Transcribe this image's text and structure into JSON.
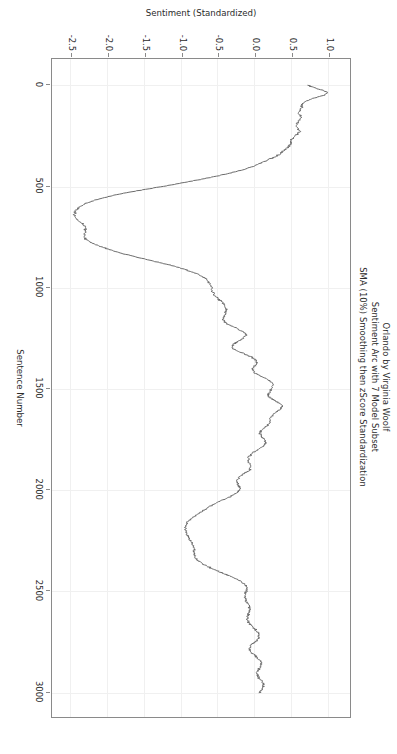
{
  "figure": {
    "title_lines": [
      "Orlando by Virginia Woolf",
      "Sentiment Arc with 7 Model Subset",
      "SMA (10%) Smoothing then zScore Standardization"
    ],
    "rotation_note": "90",
    "background_color": "#ffffff",
    "line_color": "#6b6b6b",
    "grid_color": "#f0f0f0",
    "frame_color": "#8a8a8a"
  },
  "chart_data": {
    "type": "line",
    "title": "Orlando by Virginia Woolf\nSentiment Arc with 7 Model Subset\nSMA (10%) Smoothing then zScore Standardization",
    "xlabel": "Sentence Number",
    "ylabel": "Sentiment (Standardized)",
    "xlim": [
      -130,
      3130
    ],
    "ylim": [
      -2.78,
      1.28
    ],
    "xticks": [
      0,
      500,
      1000,
      1500,
      2000,
      2500,
      3000
    ],
    "xticklabels": [
      "0",
      "500",
      "1000",
      "1500",
      "2000",
      "2500",
      "3000"
    ],
    "yticks": [
      1.0,
      0.5,
      0.0,
      -0.5,
      -1.0,
      -1.5,
      -2.0,
      -2.5
    ],
    "yticklabels": [
      "1.0",
      "0.5",
      "0.0",
      "-0.5",
      "-1.0",
      "-1.5",
      "-2.0",
      "-2.5"
    ],
    "grid": true,
    "legend": null,
    "series": [
      {
        "name": "Sentiment (Standardized)",
        "color": "#6b6b6b",
        "linewidth": 1.0,
        "x": [
          0,
          12,
          24,
          36,
          48,
          60,
          72,
          84,
          96,
          108,
          120,
          132,
          144,
          156,
          168,
          180,
          192,
          204,
          216,
          228,
          240,
          252,
          264,
          276,
          288,
          300,
          312,
          324,
          336,
          348,
          360,
          372,
          384,
          396,
          408,
          420,
          432,
          444,
          456,
          468,
          480,
          492,
          504,
          516,
          528,
          540,
          552,
          564,
          576,
          588,
          600,
          612,
          624,
          636,
          648,
          660,
          672,
          684,
          696,
          708,
          720,
          732,
          744,
          756,
          768,
          780,
          792,
          804,
          816,
          828,
          840,
          852,
          864,
          876,
          888,
          900,
          912,
          924,
          936,
          948,
          960,
          972,
          984,
          996,
          1008,
          1020,
          1032,
          1044,
          1056,
          1068,
          1080,
          1092,
          1104,
          1116,
          1128,
          1140,
          1152,
          1164,
          1176,
          1188,
          1200,
          1212,
          1224,
          1236,
          1248,
          1260,
          1272,
          1284,
          1296,
          1308,
          1320,
          1332,
          1344,
          1356,
          1368,
          1380,
          1392,
          1404,
          1416,
          1428,
          1440,
          1452,
          1464,
          1476,
          1488,
          1500,
          1512,
          1524,
          1536,
          1548,
          1560,
          1572,
          1584,
          1596,
          1608,
          1620,
          1632,
          1644,
          1656,
          1668,
          1680,
          1692,
          1704,
          1716,
          1728,
          1740,
          1752,
          1764,
          1776,
          1788,
          1800,
          1812,
          1824,
          1836,
          1848,
          1860,
          1872,
          1884,
          1896,
          1908,
          1920,
          1932,
          1944,
          1956,
          1968,
          1980,
          1992,
          2004,
          2016,
          2028,
          2040,
          2052,
          2064,
          2076,
          2088,
          2100,
          2112,
          2124,
          2136,
          2148,
          2160,
          2172,
          2184,
          2196,
          2208,
          2220,
          2232,
          2244,
          2256,
          2268,
          2280,
          2292,
          2304,
          2316,
          2328,
          2340,
          2352,
          2364,
          2376,
          2388,
          2400,
          2412,
          2424,
          2436,
          2448,
          2460,
          2472,
          2484,
          2496,
          2508,
          2520,
          2532,
          2544,
          2556,
          2568,
          2580,
          2592,
          2604,
          2616,
          2628,
          2640,
          2652,
          2664,
          2676,
          2688,
          2700,
          2712,
          2724,
          2736,
          2748,
          2760,
          2772,
          2784,
          2796,
          2808,
          2820,
          2832,
          2844,
          2856,
          2868,
          2880,
          2892,
          2904,
          2916,
          2928,
          2940,
          2952,
          2964,
          2976,
          2988,
          3000
        ],
        "y": [
          0.72,
          0.8,
          0.9,
          0.98,
          0.93,
          0.83,
          0.72,
          0.66,
          0.62,
          0.63,
          0.61,
          0.58,
          0.6,
          0.63,
          0.61,
          0.58,
          0.56,
          0.56,
          0.58,
          0.6,
          0.57,
          0.53,
          0.5,
          0.48,
          0.48,
          0.46,
          0.42,
          0.38,
          0.34,
          0.29,
          0.22,
          0.14,
          0.07,
          0.0,
          -0.09,
          -0.2,
          -0.33,
          -0.47,
          -0.62,
          -0.79,
          -0.96,
          -1.14,
          -1.33,
          -1.52,
          -1.71,
          -1.88,
          -2.02,
          -2.14,
          -2.24,
          -2.32,
          -2.38,
          -2.42,
          -2.44,
          -2.45,
          -2.44,
          -2.42,
          -2.38,
          -2.34,
          -2.31,
          -2.3,
          -2.3,
          -2.31,
          -2.32,
          -2.31,
          -2.27,
          -2.21,
          -2.13,
          -2.04,
          -1.94,
          -1.83,
          -1.7,
          -1.57,
          -1.43,
          -1.29,
          -1.16,
          -1.04,
          -0.93,
          -0.84,
          -0.76,
          -0.7,
          -0.66,
          -0.63,
          -0.61,
          -0.6,
          -0.59,
          -0.58,
          -0.56,
          -0.53,
          -0.5,
          -0.46,
          -0.43,
          -0.41,
          -0.4,
          -0.4,
          -0.41,
          -0.43,
          -0.44,
          -0.43,
          -0.39,
          -0.33,
          -0.26,
          -0.19,
          -0.14,
          -0.13,
          -0.16,
          -0.21,
          -0.27,
          -0.31,
          -0.31,
          -0.27,
          -0.2,
          -0.12,
          -0.05,
          0.0,
          0.02,
          0.01,
          -0.02,
          -0.04,
          -0.03,
          0.02,
          0.09,
          0.16,
          0.21,
          0.24,
          0.24,
          0.22,
          0.19,
          0.17,
          0.18,
          0.22,
          0.28,
          0.33,
          0.36,
          0.35,
          0.31,
          0.26,
          0.22,
          0.2,
          0.2,
          0.19,
          0.16,
          0.12,
          0.08,
          0.06,
          0.07,
          0.1,
          0.13,
          0.14,
          0.12,
          0.08,
          0.03,
          -0.02,
          -0.06,
          -0.09,
          -0.1,
          -0.09,
          -0.07,
          -0.06,
          -0.07,
          -0.11,
          -0.16,
          -0.21,
          -0.24,
          -0.25,
          -0.24,
          -0.22,
          -0.21,
          -0.22,
          -0.26,
          -0.32,
          -0.39,
          -0.47,
          -0.54,
          -0.6,
          -0.65,
          -0.7,
          -0.75,
          -0.8,
          -0.85,
          -0.89,
          -0.92,
          -0.94,
          -0.95,
          -0.95,
          -0.94,
          -0.93,
          -0.91,
          -0.89,
          -0.87,
          -0.85,
          -0.84,
          -0.83,
          -0.83,
          -0.83,
          -0.82,
          -0.8,
          -0.76,
          -0.71,
          -0.65,
          -0.58,
          -0.5,
          -0.42,
          -0.34,
          -0.27,
          -0.21,
          -0.16,
          -0.13,
          -0.12,
          -0.12,
          -0.13,
          -0.14,
          -0.14,
          -0.13,
          -0.11,
          -0.09,
          -0.08,
          -0.08,
          -0.09,
          -0.1,
          -0.11,
          -0.11,
          -0.1,
          -0.07,
          -0.04,
          0.0,
          0.03,
          0.05,
          0.05,
          0.03,
          0.0,
          -0.04,
          -0.07,
          -0.08,
          -0.07,
          -0.04,
          0.0,
          0.04,
          0.07,
          0.08,
          0.07,
          0.05,
          0.03,
          0.02,
          0.03,
          0.05,
          0.08,
          0.1,
          0.11,
          0.1,
          0.08,
          0.05
        ]
      }
    ]
  }
}
